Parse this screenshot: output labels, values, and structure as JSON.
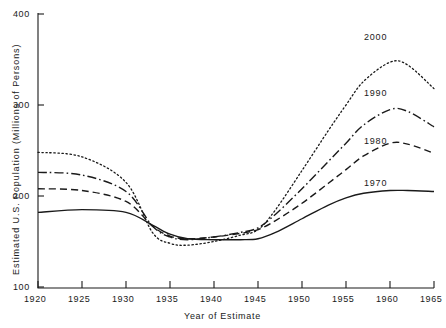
{
  "chart_data": {
    "type": "line",
    "title": "",
    "xlabel": "Year of Estimate",
    "ylabel": "Estimated U.S. Population (Millions of Persons)",
    "xlim": [
      1920,
      1965
    ],
    "ylim": [
      100,
      400
    ],
    "xticks": [
      1920,
      1925,
      1930,
      1935,
      1940,
      1945,
      1950,
      1955,
      1960,
      1965
    ],
    "xtick_labels": [
      "1920",
      "1925",
      "1930",
      "1935",
      "1940",
      "1945",
      "1950",
      "1955",
      "1960",
      "1965"
    ],
    "yticks": [
      100,
      200,
      300,
      400
    ],
    "ytick_labels": [
      "100",
      "200",
      "300",
      "400"
    ],
    "grid": false,
    "legend_position": "inline-right-annotations",
    "x": [
      1920,
      1925,
      1930,
      1933,
      1935,
      1937,
      1940,
      1943,
      1945,
      1947,
      1950,
      1953,
      1955,
      1957,
      1960,
      1962,
      1965
    ],
    "series": [
      {
        "name": "2000",
        "label": "2000",
        "dash": "dotted",
        "color": "#1a1a1a",
        "values": [
          248,
          243,
          215,
          160,
          148,
          146,
          150,
          157,
          163,
          185,
          228,
          272,
          300,
          326,
          347,
          344,
          318
        ]
      },
      {
        "name": "1990",
        "label": "1990",
        "dash": "dash-dot",
        "color": "#1a1a1a",
        "values": [
          226,
          223,
          205,
          167,
          155,
          152,
          155,
          160,
          165,
          180,
          208,
          238,
          258,
          278,
          295,
          293,
          276
        ]
      },
      {
        "name": "1980",
        "label": "1980",
        "dash": "dashed",
        "color": "#1a1a1a",
        "values": [
          208,
          206,
          194,
          167,
          156,
          153,
          155,
          159,
          163,
          173,
          192,
          214,
          229,
          244,
          258,
          257,
          247
        ]
      },
      {
        "name": "1970",
        "label": "1970",
        "dash": "solid",
        "color": "#1a1a1a",
        "values": [
          182,
          185,
          182,
          168,
          158,
          153,
          152,
          152,
          153,
          160,
          175,
          190,
          198,
          203,
          206,
          206,
          205
        ]
      }
    ]
  },
  "axis": {
    "ylabel": "Estimated U.S. Population (Millions of Persons)",
    "xlabel": "Year of Estimate"
  },
  "yticks": {
    "t400": "400",
    "t300": "300",
    "t200": "200",
    "t100": "100"
  },
  "xticks": {
    "t1920": "1920",
    "t1925": "1925",
    "t1930": "1930",
    "t1935": "1935",
    "t1940": "1940",
    "t1945": "1945",
    "t1950": "1950",
    "t1955": "1955",
    "t1960": "1960",
    "t1965": "1965"
  },
  "series_labels": {
    "s2000": "2000",
    "s1990": "1990",
    "s1980": "1980",
    "s1970": "1970"
  }
}
